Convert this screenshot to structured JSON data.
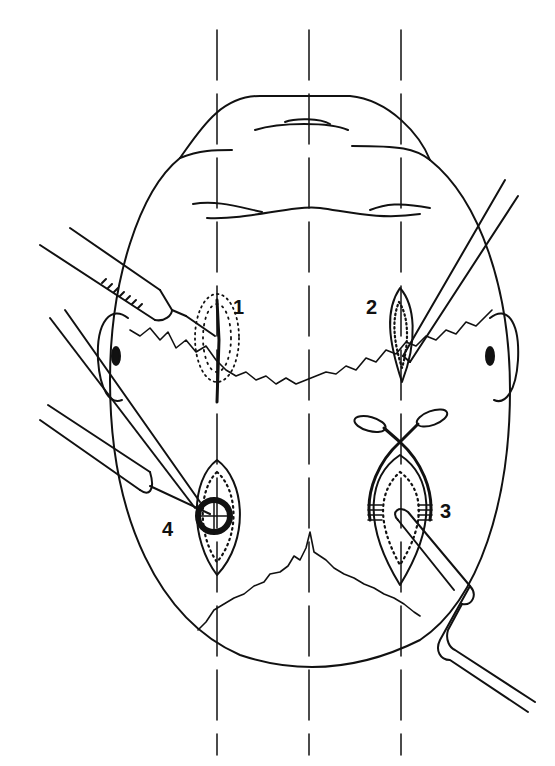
{
  "figure": {
    "type": "surgical-technique-illustration",
    "view": "top-down view of scalp/head",
    "stroke_color": "#111111",
    "background": "#ffffff",
    "guide_lines": {
      "count": 3,
      "style": "dashed-vertical",
      "x_positions": [
        217,
        309,
        401
      ]
    },
    "steps": [
      {
        "id": "step-1",
        "label": "1",
        "description": "local anesthetic injection with syringe, stippled infiltration zone, vertical incision line"
      },
      {
        "id": "step-2",
        "label": "2",
        "description": "incision opened, instrument inserted into wound"
      },
      {
        "id": "step-3",
        "label": "3",
        "description": "wound held open with scissors, curved instrument/tube in wound with ligature wraps"
      },
      {
        "id": "step-4",
        "label": "4",
        "description": "circular implant (burr hole) placed in opened incision with two instruments"
      }
    ]
  }
}
